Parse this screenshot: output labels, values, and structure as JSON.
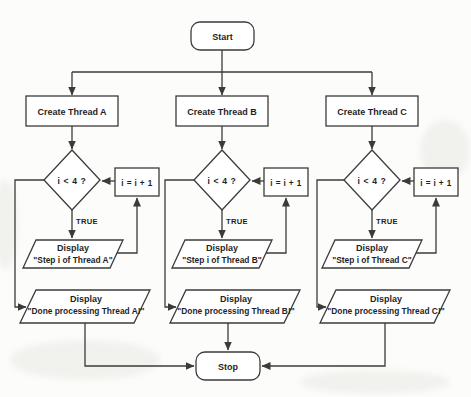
{
  "diagram": {
    "type": "flowchart",
    "start_label": "Start",
    "stop_label": "Stop",
    "colors": {
      "line": "#3b3b3b",
      "text": "#1f1f1f",
      "background": "#fcfcfa",
      "node_fill": "#ffffff"
    },
    "branches": [
      {
        "create_label": "Create Thread A",
        "decision_label": "i < 4 ?",
        "increment_label": "i = i + 1",
        "true_label": "TRUE",
        "step_display_line1": "Display",
        "step_display_line2": "\"Step i of Thread A\"",
        "done_display_line1": "Display",
        "done_display_line2": "\"Done processing Thread A!\""
      },
      {
        "create_label": "Create Thread B",
        "decision_label": "i < 4 ?",
        "increment_label": "i = i + 1",
        "true_label": "TRUE",
        "step_display_line1": "Display",
        "step_display_line2": "\"Step i of Thread B\"",
        "done_display_line1": "Display",
        "done_display_line2": "\"Done processing Thread B!\""
      },
      {
        "create_label": "Create Thread C",
        "decision_label": "i < 4 ?",
        "increment_label": "i = i + 1",
        "true_label": "TRUE",
        "step_display_line1": "Display",
        "step_display_line2": "\"Step i of Thread C\"",
        "done_display_line1": "Display",
        "done_display_line2": "\"Done processing Thread C!\""
      }
    ]
  }
}
